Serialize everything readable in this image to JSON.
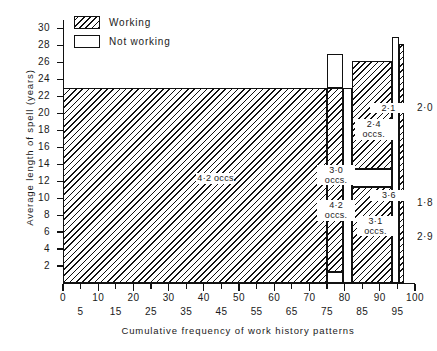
{
  "chart_data": {
    "type": "bar",
    "title": "",
    "xlabel": "Cumulative frequency of work history patterns",
    "ylabel": "Average length of spell (years)",
    "xlim": [
      0,
      100
    ],
    "ylim": [
      0,
      31
    ],
    "grid": false,
    "legend": {
      "position": "top-left",
      "entries": [
        {
          "label": "Working",
          "fill": "hatched"
        },
        {
          "label": "Not working",
          "fill": "blank"
        }
      ]
    },
    "xticks_major": [
      "0",
      "10",
      "20",
      "30",
      "40",
      "50",
      "60",
      "70",
      "80",
      "90",
      "100"
    ],
    "xticks_minor": [
      "5",
      "15",
      "25",
      "35",
      "45",
      "55",
      "65",
      "75",
      "85",
      "95"
    ],
    "yticks": [
      "2",
      "4",
      "6",
      "8",
      "10",
      "12",
      "14",
      "16",
      "18",
      "20",
      "22",
      "24",
      "26",
      "28",
      "30"
    ],
    "bars": [
      {
        "x0": 0,
        "x1": 75,
        "top": 23,
        "segments": [
          {
            "from": 0,
            "to": 23,
            "fill": "hatched",
            "label": "4·2 occs."
          }
        ]
      },
      {
        "x0": 75,
        "x1": 79.5,
        "top": 27,
        "segments": [
          {
            "from": 23,
            "to": 27,
            "fill": "blank",
            "label": ""
          },
          {
            "from": 12.1,
            "to": 23,
            "fill": "hatched",
            "label": "3·0 occs."
          },
          {
            "from": 1.3,
            "to": 12.1,
            "fill": "hatched",
            "label": "4·2 occs."
          },
          {
            "from": 0,
            "to": 1.3,
            "fill": "blank",
            "label": ""
          }
        ]
      },
      {
        "x0": 79.5,
        "x1": 82,
        "top": 23,
        "segments": [
          {
            "from": 0,
            "to": 23,
            "fill": "blank",
            "label": ""
          }
        ]
      },
      {
        "x0": 82,
        "x1": 93.5,
        "top": 26.2,
        "segments": [
          {
            "from": 13.4,
            "to": 26.2,
            "fill": "hatched",
            "label": "2·4 occs."
          },
          {
            "from": 11.3,
            "to": 13.4,
            "fill": "blank",
            "label": ""
          },
          {
            "from": 0,
            "to": 11.3,
            "fill": "hatched",
            "label": "3·1 occs."
          }
        ]
      },
      {
        "x0": 93.5,
        "x1": 95.5,
        "top": 29,
        "segments": [
          {
            "from": 0,
            "to": 29,
            "fill": "blank",
            "label": ""
          }
        ]
      },
      {
        "x0": 95.5,
        "x1": 96.8,
        "top": 28.2,
        "segments": [
          {
            "from": 0,
            "to": 28.2,
            "fill": "hatched",
            "label": ""
          }
        ]
      }
    ],
    "inner_labels": [
      {
        "text": "4·2 occs.",
        "x": 43,
        "y": 12.3,
        "name": "label-main-42-occs"
      },
      {
        "text": "3·0",
        "x": 77.3,
        "y": 13.3,
        "name": "label-30-occs-line1"
      },
      {
        "text": "occs.",
        "x": 77.3,
        "y": 12.1,
        "name": "label-30-occs-line2"
      },
      {
        "text": "4·2",
        "x": 77.3,
        "y": 9.1,
        "name": "label-42-occs-line1"
      },
      {
        "text": "occs.",
        "x": 77.3,
        "y": 7.9,
        "name": "label-42-occs-line2"
      },
      {
        "text": "2·4",
        "x": 88.0,
        "y": 18.7,
        "name": "label-24-occs-line1"
      },
      {
        "text": "occs.",
        "x": 88.0,
        "y": 17.5,
        "name": "label-24-occs-line2"
      },
      {
        "text": "3·1",
        "x": 88.5,
        "y": 7.3,
        "name": "label-31-occs-line1"
      },
      {
        "text": "occs.",
        "x": 88.5,
        "y": 6.1,
        "name": "label-31-occs-line2"
      },
      {
        "text": "2·1",
        "x": 92.2,
        "y": 20.6,
        "name": "label-21"
      },
      {
        "text": "3·6",
        "x": 92.3,
        "y": 10.3,
        "name": "label-36"
      }
    ],
    "right_labels": [
      {
        "text": "2·0",
        "y": 20.6,
        "name": "label-right-20"
      },
      {
        "text": "1·8",
        "y": 9.4,
        "name": "label-right-18"
      },
      {
        "text": "2·9",
        "y": 5.4,
        "name": "label-right-29"
      }
    ]
  }
}
